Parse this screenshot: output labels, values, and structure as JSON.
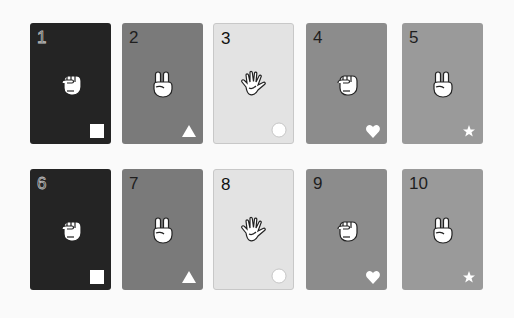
{
  "cards": [
    {
      "number": "1",
      "gesture": "rock-fist",
      "symbol": "square",
      "color": "#242424",
      "num_color": "#242424",
      "num_outline": true
    },
    {
      "number": "2",
      "gesture": "scissors-peace",
      "symbol": "triangle",
      "color": "#7a7a7a",
      "num_color": "#1e1e1e",
      "num_outline": false
    },
    {
      "number": "3",
      "gesture": "paper-open",
      "symbol": "circle",
      "color": "#e3e3e3",
      "num_color": "#111111",
      "num_outline": false
    },
    {
      "number": "4",
      "gesture": "rock-fist",
      "symbol": "heart",
      "color": "#8c8c8c",
      "num_color": "#1e1e1e",
      "num_outline": false
    },
    {
      "number": "5",
      "gesture": "scissors-peace",
      "symbol": "star",
      "color": "#9a9a9a",
      "num_color": "#1e1e1e",
      "num_outline": false
    },
    {
      "number": "6",
      "gesture": "rock-fist",
      "symbol": "square",
      "color": "#242424",
      "num_color": "#242424",
      "num_outline": true
    },
    {
      "number": "7",
      "gesture": "scissors-peace",
      "symbol": "triangle",
      "color": "#7a7a7a",
      "num_color": "#1e1e1e",
      "num_outline": false
    },
    {
      "number": "8",
      "gesture": "paper-open",
      "symbol": "circle",
      "color": "#e3e3e3",
      "num_color": "#111111",
      "num_outline": false
    },
    {
      "number": "9",
      "gesture": "rock-fist",
      "symbol": "heart",
      "color": "#8c8c8c",
      "num_color": "#1e1e1e",
      "num_outline": false
    },
    {
      "number": "10",
      "gesture": "scissors-peace",
      "symbol": "star",
      "color": "#9a9a9a",
      "num_color": "#1e1e1e",
      "num_outline": false
    }
  ]
}
